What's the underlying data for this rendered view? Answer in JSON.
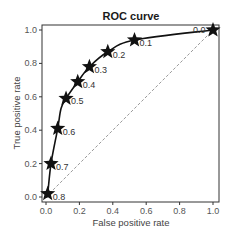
{
  "chart_data": {
    "type": "line",
    "title": "ROC curve",
    "xlabel": "False positive rate",
    "ylabel": "True positive rate",
    "xlim": [
      0.0,
      1.0
    ],
    "ylim": [
      0.0,
      1.0
    ],
    "xticks": [
      "0.0",
      "0.2",
      "0.4",
      "0.6",
      "0.8",
      "1.0"
    ],
    "yticks": [
      "0.0",
      "0.2",
      "0.4",
      "0.6",
      "0.8",
      "1.0"
    ],
    "grid": false,
    "legend": null,
    "series": [
      {
        "name": "ROC",
        "style": "solid black line with star markers at thresholds",
        "x": [
          0.0,
          0.01,
          0.03,
          0.07,
          0.09,
          0.12,
          0.19,
          0.26,
          0.37,
          0.53,
          1.0
        ],
        "y": [
          0.0,
          0.02,
          0.2,
          0.41,
          0.53,
          0.59,
          0.69,
          0.78,
          0.87,
          0.94,
          1.0
        ]
      },
      {
        "name": "Chance",
        "style": "dashed gray diagonal",
        "x": [
          0.0,
          1.0
        ],
        "y": [
          0.0,
          1.0
        ]
      }
    ],
    "annotations": [
      {
        "label": "0.8",
        "x": 0.01,
        "y": 0.02
      },
      {
        "label": "0.7",
        "x": 0.03,
        "y": 0.2
      },
      {
        "label": "0.6",
        "x": 0.07,
        "y": 0.41
      },
      {
        "label": "0.5",
        "x": 0.12,
        "y": 0.59
      },
      {
        "label": "0.4",
        "x": 0.19,
        "y": 0.69
      },
      {
        "label": "0.3",
        "x": 0.26,
        "y": 0.78
      },
      {
        "label": "0.2",
        "x": 0.37,
        "y": 0.87
      },
      {
        "label": "0.1",
        "x": 0.53,
        "y": 0.94
      },
      {
        "label": "0.0",
        "x": 1.0,
        "y": 1.0
      }
    ]
  },
  "colors": {
    "curve": "#111111",
    "diagonal": "#9a9a9a",
    "axes": "#333333",
    "text": "#444444"
  }
}
